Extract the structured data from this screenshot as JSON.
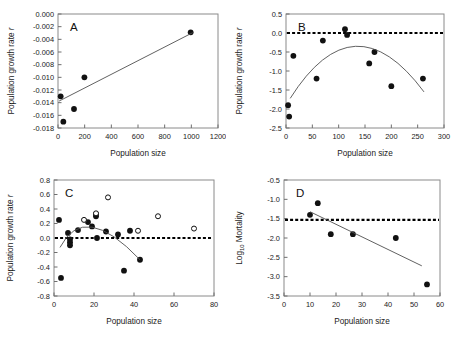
{
  "figure": {
    "panels": [
      "A",
      "B",
      "C",
      "D"
    ]
  },
  "chart_data": [
    {
      "type": "scatter",
      "panel": "A",
      "title": "A",
      "xlabel": "Population size",
      "ylabel": "Population growth rate r",
      "xlim": [
        0,
        1200
      ],
      "ylim": [
        -0.018,
        0.0
      ],
      "xticks": [
        0,
        200,
        400,
        600,
        800,
        1000,
        1200
      ],
      "xticklabels": [
        "0",
        "200",
        "400",
        "600",
        "800",
        "1000",
        "1200"
      ],
      "yticks": [
        0.0,
        -0.002,
        -0.004,
        -0.006,
        -0.008,
        -0.01,
        -0.012,
        -0.014,
        -0.016,
        -0.018
      ],
      "yticklabels": [
        "0.000",
        "-0.002",
        "-0.004",
        "-0.006",
        "-0.008",
        "-0.010",
        "-0.012",
        "-0.014",
        "-0.016",
        "-0.018"
      ],
      "grid": false,
      "legend": "none",
      "series": [
        {
          "name": "observations",
          "marker": "filled-circle",
          "points": [
            {
              "x": 20,
              "y": -0.013
            },
            {
              "x": 40,
              "y": -0.017
            },
            {
              "x": 120,
              "y": -0.015
            },
            {
              "x": 198,
              "y": -0.01
            },
            {
              "x": 995,
              "y": -0.0029
            }
          ]
        },
        {
          "name": "linear-fit",
          "type": "line",
          "points": [
            {
              "x": 8,
              "y": -0.01375
            },
            {
              "x": 1010,
              "y": -0.00295
            }
          ]
        }
      ]
    },
    {
      "type": "scatter",
      "panel": "B",
      "title": "B",
      "xlabel": "Population size",
      "ylabel": "Population growth rate r",
      "xlim": [
        0,
        300
      ],
      "ylim": [
        -2.5,
        0.5
      ],
      "xticks": [
        0,
        50,
        100,
        150,
        200,
        250,
        300
      ],
      "xticklabels": [
        "0",
        "50",
        "100",
        "150",
        "200",
        "250",
        "300"
      ],
      "yticks": [
        0.5,
        0.0,
        -0.5,
        -1.0,
        -1.5,
        -2.0,
        -2.5
      ],
      "yticklabels": [
        "0.5",
        "0.0",
        "-0.5",
        "-1.0",
        "-1.5",
        "-2.0",
        "-2.5"
      ],
      "grid": false,
      "legend": "none",
      "reference_line": {
        "y": 0.0,
        "style": "dotted"
      },
      "series": [
        {
          "name": "observations",
          "marker": "filled-circle",
          "points": [
            {
              "x": 4,
              "y": -1.9
            },
            {
              "x": 6,
              "y": -2.2
            },
            {
              "x": 14,
              "y": -0.6
            },
            {
              "x": 58,
              "y": -1.2
            },
            {
              "x": 70,
              "y": -0.2
            },
            {
              "x": 112,
              "y": 0.1
            },
            {
              "x": 116,
              "y": -0.05
            },
            {
              "x": 158,
              "y": -0.8
            },
            {
              "x": 168,
              "y": -0.5
            },
            {
              "x": 200,
              "y": -1.4
            },
            {
              "x": 260,
              "y": -1.2
            }
          ]
        },
        {
          "name": "quadratic-fit",
          "type": "curve",
          "vertex": {
            "x": 132,
            "y": -0.35
          },
          "x_start": 8,
          "x_end": 262,
          "y_start": -1.72,
          "y_end": -1.55
        }
      ]
    },
    {
      "type": "scatter",
      "panel": "C",
      "title": "C",
      "xlabel": "Population size",
      "ylabel": "Population growth rate r",
      "xlim": [
        0,
        80
      ],
      "ylim": [
        -0.8,
        0.8
      ],
      "xticks": [
        0,
        20,
        40,
        60,
        80
      ],
      "xticklabels": [
        "0",
        "20",
        "40",
        "60",
        "80"
      ],
      "yticks": [
        0.8,
        0.6,
        0.4,
        0.2,
        0.0,
        -0.2,
        -0.4,
        -0.6,
        -0.8
      ],
      "yticklabels": [
        "0.8",
        "0.6",
        "0.4",
        "0.2",
        "0.0",
        "-0.2",
        "-0.4",
        "-0.6",
        "-0.8"
      ],
      "grid": false,
      "legend": "none",
      "reference_line": {
        "y": 0.0,
        "style": "dotted"
      },
      "series": [
        {
          "name": "observations-filled",
          "marker": "filled-circle",
          "points": [
            {
              "x": 2.5,
              "y": 0.25
            },
            {
              "x": 3.5,
              "y": -0.55
            },
            {
              "x": 7,
              "y": 0.07
            },
            {
              "x": 8,
              "y": -0.02
            },
            {
              "x": 8,
              "y": -0.06
            },
            {
              "x": 8,
              "y": -0.1
            },
            {
              "x": 12,
              "y": 0.11
            },
            {
              "x": 17,
              "y": 0.22
            },
            {
              "x": 19,
              "y": 0.16
            },
            {
              "x": 21,
              "y": 0.33
            },
            {
              "x": 21,
              "y": 0.3
            },
            {
              "x": 21.5,
              "y": 0.0
            },
            {
              "x": 26,
              "y": 0.09
            },
            {
              "x": 32,
              "y": 0.05
            },
            {
              "x": 35,
              "y": -0.45
            },
            {
              "x": 38,
              "y": 0.1
            },
            {
              "x": 43,
              "y": -0.3
            }
          ]
        },
        {
          "name": "observations-open",
          "marker": "open-circle",
          "points": [
            {
              "x": 15,
              "y": 0.25
            },
            {
              "x": 21,
              "y": 0.34
            },
            {
              "x": 27,
              "y": 0.56
            },
            {
              "x": 42,
              "y": 0.1
            },
            {
              "x": 52,
              "y": 0.3
            },
            {
              "x": 70,
              "y": 0.13
            }
          ]
        },
        {
          "name": "quadratic-fit",
          "type": "curve",
          "vertex": {
            "x": 19,
            "y": 0.15
          },
          "x_start": 3,
          "x_end": 43,
          "y_start": -0.13,
          "y_end": -0.3
        }
      ]
    },
    {
      "type": "scatter",
      "panel": "D",
      "title": "D",
      "xlabel": "Population size",
      "ylabel": "Log10 Mortality",
      "ylabel_base": "Log",
      "ylabel_sub": "10",
      "ylabel_rest": " Mortality",
      "xlim": [
        0,
        60
      ],
      "ylim": [
        -3.5,
        -0.5
      ],
      "xticks": [
        0,
        10,
        20,
        30,
        40,
        50,
        60
      ],
      "xticklabels": [
        "0",
        "10",
        "20",
        "30",
        "40",
        "50",
        "60"
      ],
      "yticks": [
        -0.5,
        -1.0,
        -1.5,
        -2.0,
        -2.5,
        -3.0,
        -3.5
      ],
      "yticklabels": [
        "-0.5",
        "-1.0",
        "-1.5",
        "-2.0",
        "-2.5",
        "-3.0",
        "-3.5"
      ],
      "grid": false,
      "legend": "none",
      "reference_line": {
        "y": -1.53,
        "style": "dotted"
      },
      "series": [
        {
          "name": "observations",
          "marker": "filled-circle",
          "points": [
            {
              "x": 10,
              "y": -1.4
            },
            {
              "x": 13,
              "y": -1.1
            },
            {
              "x": 18,
              "y": -1.9
            },
            {
              "x": 26.5,
              "y": -1.9
            },
            {
              "x": 43,
              "y": -2.0
            },
            {
              "x": 55,
              "y": -3.2
            }
          ]
        },
        {
          "name": "linear-fit",
          "type": "line",
          "points": [
            {
              "x": 10,
              "y": -1.32
            },
            {
              "x": 53,
              "y": -2.72
            }
          ]
        }
      ]
    }
  ]
}
